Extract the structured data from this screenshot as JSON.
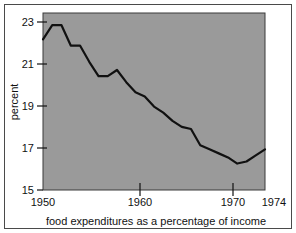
{
  "chart_data": {
    "type": "line",
    "title": "",
    "subtitle": "",
    "xlabel": "food expenditures as a percentage of income",
    "ylabel": "percent",
    "xlim": [
      1950,
      1974
    ],
    "ylim": [
      15,
      23.7
    ],
    "grid": false,
    "legend": null,
    "plot_background": "#9a9a9a",
    "line_color": "#111111",
    "x_tick_labels": [
      "1950",
      "1960",
      "1970",
      "1974"
    ],
    "x_ticks": [
      1950,
      1960,
      1970,
      1974
    ],
    "y_tick_labels": [
      "15",
      "17",
      "19",
      "21",
      "23"
    ],
    "y_ticks": [
      15,
      17,
      19,
      21,
      23
    ],
    "series": [
      {
        "name": "food expenditures as a percentage of income",
        "x": [
          1950,
          1951,
          1952,
          1953,
          1954,
          1955,
          1956,
          1957,
          1958,
          1959,
          1960,
          1961,
          1962,
          1963,
          1964,
          1965,
          1966,
          1967,
          1968,
          1969,
          1970,
          1971,
          1972,
          1973,
          1974
        ],
        "values": [
          22.4,
          23.1,
          23.1,
          22.1,
          22.1,
          21.3,
          20.6,
          20.6,
          20.9,
          20.3,
          19.8,
          19.6,
          19.1,
          18.8,
          18.4,
          18.1,
          18.0,
          17.2,
          17.0,
          16.8,
          16.6,
          16.3,
          16.4,
          16.7,
          17.0
        ]
      }
    ]
  },
  "axis_labels": {
    "y_title": "percent",
    "x_title": "food expenditures as a percentage of income"
  }
}
